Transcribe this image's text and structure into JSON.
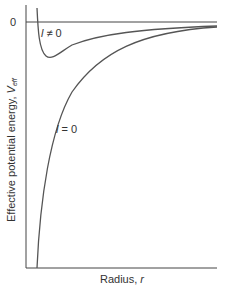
{
  "figure": {
    "zero_label": "0",
    "y_axis_label": "Effective potential energy, ",
    "y_axis_var": "V",
    "y_axis_sub": "eff",
    "x_axis_label": "Radius, ",
    "x_axis_var": "r",
    "curve_labels": {
      "l_nonzero_var": "l",
      "l_nonzero_rest": " ≠ 0",
      "l_zero_var": "l",
      "l_zero_rest": " = 0"
    },
    "colors": {
      "axis": "#444444",
      "curve": "#555555"
    }
  }
}
